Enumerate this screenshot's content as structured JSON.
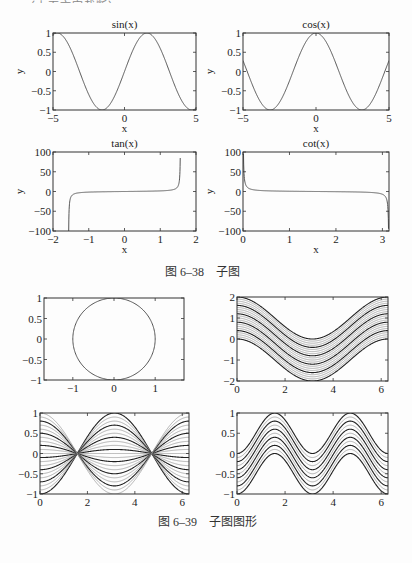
{
  "top_fragment": "……（上页文字截断）",
  "captions": {
    "fig1": "图 6–38　子图",
    "fig2": "图 6–39　子图图形"
  },
  "colors": {
    "axis": "#333333",
    "curve": "#555555",
    "dark": "#222222",
    "light": "#9a9a9a"
  },
  "chart_data": [
    {
      "id": "sin",
      "type": "line",
      "title": "sin(x)",
      "xlabel": "x",
      "ylabel": "y",
      "box": [
        53,
        33,
        196,
        110
      ],
      "xlim": [
        -5,
        5
      ],
      "ylim": [
        -1,
        1
      ],
      "xticks": [
        -5,
        0,
        5
      ],
      "xtick_labels": [
        "−5",
        "0",
        "5"
      ],
      "yticks": [
        1,
        0.5,
        0,
        -0.5,
        -1
      ],
      "ytick_labels": [
        "1",
        "0.5",
        "0",
        "−0.5",
        "−1"
      ],
      "func": "sin",
      "domain": [
        -4.7,
        4.7
      ]
    },
    {
      "id": "cos",
      "type": "line",
      "title": "cos(x)",
      "xlabel": "x",
      "ylabel": "y",
      "box": [
        243,
        33,
        389,
        110
      ],
      "xlim": [
        -5,
        5
      ],
      "ylim": [
        -1,
        1
      ],
      "xticks": [
        -5,
        0,
        5
      ],
      "xtick_labels": [
        "−5",
        "0",
        "5"
      ],
      "yticks": [
        1,
        0.5,
        0,
        -0.5,
        -1
      ],
      "ytick_labels": [
        "1",
        "0.5",
        "0",
        "−0.5",
        "−1"
      ],
      "func": "cos",
      "domain": [
        -5,
        5
      ]
    },
    {
      "id": "tan",
      "type": "line",
      "title": "tan(x)",
      "xlabel": "x",
      "ylabel": "y",
      "box": [
        53,
        152,
        196,
        231
      ],
      "xlim": [
        -2,
        2
      ],
      "ylim": [
        -100,
        100
      ],
      "xticks": [
        -2,
        -1,
        0,
        1,
        2
      ],
      "xtick_labels": [
        "−2",
        "−1",
        "0",
        "1",
        "2"
      ],
      "yticks": [
        100,
        50,
        0,
        -50,
        -100
      ],
      "ytick_labels": [
        "100",
        "50",
        "0",
        "−50",
        "−100"
      ],
      "func": "tan",
      "domain": [
        -1.5608,
        1.559
      ]
    },
    {
      "id": "cot",
      "type": "line",
      "title": "cot(x)",
      "xlabel": "x",
      "ylabel": "y",
      "box": [
        243,
        152,
        389,
        231
      ],
      "xlim": [
        0,
        3.1416
      ],
      "ylim": [
        -100,
        100
      ],
      "xticks": [
        0,
        1,
        2,
        3
      ],
      "xtick_labels": [
        "0",
        "1",
        "2",
        "3"
      ],
      "yticks": [
        100,
        50,
        0,
        -50,
        -100
      ],
      "ytick_labels": [
        "100",
        "50",
        "0",
        "−50",
        "−100"
      ],
      "func": "cot",
      "domain": [
        0.0105,
        3.131
      ]
    },
    {
      "id": "circle",
      "type": "line",
      "title": "",
      "xlabel": "",
      "ylabel": "",
      "box": [
        44,
        298,
        184,
        380
      ],
      "xlim": [
        -1.7,
        1.7
      ],
      "ylim": [
        -1,
        1
      ],
      "xticks": [
        -1,
        0,
        1
      ],
      "xtick_labels": [
        "−1",
        "0",
        "1"
      ],
      "yticks": [
        1,
        0.5,
        0,
        -0.5,
        -1
      ],
      "ytick_labels": [
        "1",
        "0.5",
        "0",
        "−0.5",
        "−1"
      ],
      "func": "circle"
    },
    {
      "id": "shifted-cos",
      "type": "line",
      "title": "",
      "xlabel": "",
      "ylabel": "",
      "box": [
        237,
        297,
        388,
        381
      ],
      "xlim": [
        0,
        6.2832
      ],
      "ylim": [
        -2,
        2
      ],
      "xticks": [
        0,
        2,
        4,
        6
      ],
      "xtick_labels": [
        "0",
        "2",
        "4",
        "6"
      ],
      "yticks": [
        2,
        1,
        0,
        -1,
        -2
      ],
      "ytick_labels": [
        "2",
        "1",
        "0",
        "−1",
        "−2"
      ],
      "func": "cos+k",
      "family": {
        "count": 21,
        "offset_from": -1,
        "offset_to": 1
      }
    },
    {
      "id": "scaled-cos",
      "type": "line",
      "title": "",
      "xlabel": "",
      "ylabel": "",
      "box": [
        40,
        413,
        189,
        494
      ],
      "xlim": [
        0,
        6.2832
      ],
      "ylim": [
        -1,
        1
      ],
      "xticks": [
        0,
        2,
        4,
        6
      ],
      "xtick_labels": [
        "0",
        "2",
        "4",
        "6"
      ],
      "yticks": [
        1,
        0.5,
        0,
        -0.5,
        -1
      ],
      "ytick_labels": [
        "1",
        "0.5",
        "0",
        "−0.5",
        "−1"
      ],
      "func": "k*cos",
      "family": {
        "count": 21,
        "scale_from": -1,
        "scale_to": 1
      }
    },
    {
      "id": "scaled-abs-sin",
      "type": "line",
      "title": "",
      "xlabel": "",
      "ylabel": "",
      "box": [
        237,
        413,
        388,
        494
      ],
      "xlim": [
        0,
        6.2832
      ],
      "ylim": [
        -1,
        1
      ],
      "xticks": [
        0,
        2,
        4,
        6
      ],
      "xtick_labels": [
        "0",
        "2",
        "4",
        "6"
      ],
      "yticks": [
        1,
        0.5,
        0,
        -0.5,
        -1
      ],
      "ytick_labels": [
        "1",
        "0.5",
        "0",
        "−0.5",
        "−1"
      ],
      "func": "sin2+k",
      "family": {
        "count": 11,
        "offset_from": -1,
        "offset_to": 0
      }
    }
  ]
}
